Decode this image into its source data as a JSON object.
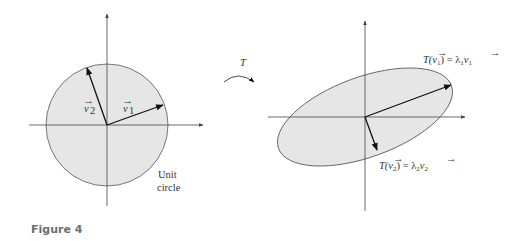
{
  "figure": {
    "caption": "Figure 4",
    "colors": {
      "fill": "#e6e6e6",
      "stroke": "#444444",
      "axis": "#444444",
      "vector": "#111111",
      "caption": "#6d6d6d"
    },
    "left_panel": {
      "shape": "circle",
      "shape_label_line1": "Unit",
      "shape_label_line2": "circle",
      "vectors": [
        {
          "name": "v1",
          "label_base": "v",
          "label_sub": "1",
          "direction": [
            0.94,
            0.33
          ]
        },
        {
          "name": "v2",
          "label_base": "v",
          "label_sub": "2",
          "direction": [
            -0.33,
            0.94
          ]
        }
      ]
    },
    "transform": {
      "label": "T"
    },
    "right_panel": {
      "shape": "ellipse",
      "vectors": [
        {
          "name": "T(v1)",
          "label": "T(v⃗₁) = λ₁v⃗₁",
          "lambda_sign": "positive",
          "scale": "stretch"
        },
        {
          "name": "T(v2)",
          "label": "T(v⃗₂) = λ₂v⃗₂",
          "lambda_sign": "negative",
          "scale": "shrink"
        }
      ],
      "label_t_v1_parts": [
        "T(",
        "v",
        "1",
        ") = λ",
        "1",
        "v",
        "1"
      ],
      "label_t_v2_parts": [
        "T(",
        "v",
        "2",
        ") = λ",
        "2",
        "v",
        "2"
      ]
    }
  }
}
